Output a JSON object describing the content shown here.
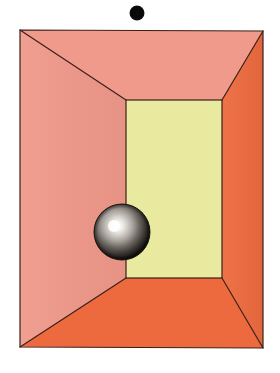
{
  "canvas": {
    "width": 280,
    "height": 373,
    "background": "#ffffff",
    "title": "one-point perspective room with sphere and floating dot"
  },
  "palette": {
    "background": "#ffffff",
    "left_wall": "#f0998a",
    "ceiling": "#f09a8b",
    "right_wall": "#ee6b3f",
    "floor": "#ed6a3e",
    "back_wall": "#e9eaa0",
    "outline": "#3b1f18",
    "dot": "#0a0a0a",
    "sphere_highlight": "#ffffff",
    "sphere_mid": "#8e8b84",
    "sphere_dark": "#141210",
    "sphere_rim": "#2a2724"
  },
  "outer_box": {
    "label": "room opening rectangle",
    "top_left": {
      "x": 20,
      "y": 30
    },
    "top_right": {
      "x": 263,
      "y": 31
    },
    "bottom_right": {
      "x": 263,
      "y": 348
    },
    "bottom_left": {
      "x": 20,
      "y": 347
    },
    "stroke_width": 1.2
  },
  "back_wall": {
    "label": "back wall rectangle",
    "top_left": {
      "x": 126,
      "y": 100
    },
    "top_right": {
      "x": 222,
      "y": 100
    },
    "bottom_right": {
      "x": 222,
      "y": 278
    },
    "bottom_left": {
      "x": 126,
      "y": 278
    },
    "color": "#e9eaa0"
  },
  "surfaces": [
    {
      "name": "ceiling",
      "points": "20,30 263,31 222,100 126,100",
      "color": "#f09a8b"
    },
    {
      "name": "left-wall",
      "points": "20,30 126,100 126,278 20,347",
      "color": "#f0998a"
    },
    {
      "name": "right-wall",
      "points": "263,31 263,348 222,278 222,100",
      "color": "#ee6b3f"
    },
    {
      "name": "floor",
      "points": "20,347 126,278 222,278 263,348",
      "color": "#ed6a3e"
    }
  ],
  "sphere": {
    "label": "chrome sphere",
    "center": {
      "x": 122,
      "y": 232
    },
    "radius": 28,
    "highlight": {
      "x": 114,
      "y": 226,
      "radius": 6
    },
    "material": "metallic"
  },
  "dot": {
    "label": "floating black dot",
    "center": {
      "x": 137,
      "y": 13
    },
    "radius": 7.5,
    "color": "#0a0a0a"
  },
  "vanishing_lines": [
    {
      "name": "top-left-diagonal",
      "from": {
        "x": 20,
        "y": 30
      },
      "to": {
        "x": 126,
        "y": 100
      }
    },
    {
      "name": "top-right-diagonal",
      "from": {
        "x": 263,
        "y": 31
      },
      "to": {
        "x": 222,
        "y": 100
      }
    },
    {
      "name": "bottom-left-diagonal",
      "from": {
        "x": 20,
        "y": 347
      },
      "to": {
        "x": 126,
        "y": 278
      }
    },
    {
      "name": "bottom-right-diagonal",
      "from": {
        "x": 263,
        "y": 348
      },
      "to": {
        "x": 222,
        "y": 278
      }
    }
  ]
}
